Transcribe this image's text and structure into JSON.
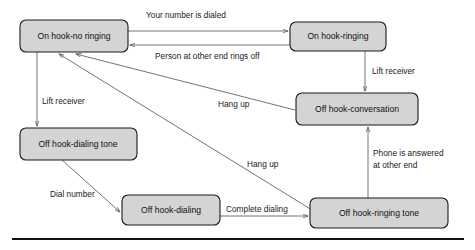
{
  "diagram": {
    "type": "state-machine",
    "colors": {
      "box_fill": "#d4d4d4",
      "box_stroke": "#1a1a1a",
      "arrow": "#5a5a5a",
      "rule": "#111111",
      "background": "#ffffff"
    },
    "states": [
      {
        "id": "on-hook-no-ringing",
        "label": "On hook-no ringing",
        "x": 20,
        "y": 20,
        "w": 108,
        "h": 32
      },
      {
        "id": "on-hook-ringing",
        "label": "On hook-ringing",
        "x": 290,
        "y": 22,
        "w": 96,
        "h": 29
      },
      {
        "id": "off-hook-conversation",
        "label": "Off hook-conversation",
        "x": 296,
        "y": 93,
        "w": 122,
        "h": 32
      },
      {
        "id": "off-hook-dialing-tone",
        "label": "Off hook-dialing tone",
        "x": 20,
        "y": 128,
        "w": 117,
        "h": 32
      },
      {
        "id": "off-hook-dialing",
        "label": "Off hook-dialing",
        "x": 122,
        "y": 195,
        "w": 98,
        "h": 30
      },
      {
        "id": "off-hook-ringing-tone",
        "label": "Off hook-ringing tone",
        "x": 310,
        "y": 198,
        "w": 138,
        "h": 30
      }
    ],
    "transitions": [
      {
        "id": "t-your-number-is-dialed",
        "label": "Your number is dialed",
        "from": "on-hook-no-ringing",
        "to": "on-hook-ringing"
      },
      {
        "id": "t-person-rings-off",
        "label": "Person at other end rings off",
        "from": "on-hook-ringing",
        "to": "on-hook-no-ringing"
      },
      {
        "id": "t-lift-receiver-right",
        "label": "Lift receiver",
        "from": "on-hook-ringing",
        "to": "off-hook-conversation"
      },
      {
        "id": "t-lift-receiver-left",
        "label": "Lift receiver",
        "from": "on-hook-no-ringing",
        "to": "off-hook-dialing-tone"
      },
      {
        "id": "t-hang-up-conversation",
        "label": "Hang up",
        "from": "off-hook-conversation",
        "to": "on-hook-no-ringing"
      },
      {
        "id": "t-hang-up-ringing-tone",
        "label": "Hang up",
        "from": "off-hook-ringing-tone",
        "to": "on-hook-no-ringing"
      },
      {
        "id": "t-dial-number",
        "label": "Dial number",
        "from": "off-hook-dialing-tone",
        "to": "off-hook-dialing"
      },
      {
        "id": "t-complete-dialing",
        "label": "Complete dialing",
        "from": "off-hook-dialing",
        "to": "off-hook-ringing-tone"
      },
      {
        "id": "t-phone-answered",
        "label": "Phone is answered",
        "label_line2": "at other end",
        "from": "off-hook-ringing-tone",
        "to": "off-hook-conversation"
      }
    ],
    "labels": {
      "your_number_is_dialed": "Your number is dialed",
      "person_at_other_end_rings_off": "Person at other end rings off",
      "lift_receiver_right": "Lift receiver",
      "lift_receiver_left": "Lift receiver",
      "hang_up_upper": "Hang up",
      "hang_up_lower": "Hang up",
      "dial_number": "Dial number",
      "complete_dialing": "Complete dialing",
      "phone_is_answered_l1": "Phone is answered",
      "phone_is_answered_l2": "at other end"
    }
  }
}
